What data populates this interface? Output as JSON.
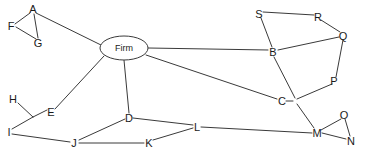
{
  "diagram": {
    "type": "node-link-graph",
    "background_color": "#ffffff",
    "line_color": "#3a3a3a",
    "label_color": "#1a1a1a",
    "width": 365,
    "height": 154,
    "hub": {
      "label": "Firm",
      "cx": 124,
      "cy": 48,
      "rx": 24,
      "ry": 12
    },
    "nodes": [
      {
        "id": "A",
        "label": "A",
        "x": 33,
        "y": 9
      },
      {
        "id": "F",
        "label": "F",
        "x": 11,
        "y": 26
      },
      {
        "id": "G",
        "label": "G",
        "x": 38,
        "y": 43
      },
      {
        "id": "H",
        "label": "H",
        "x": 13,
        "y": 99
      },
      {
        "id": "E",
        "label": "E",
        "x": 51,
        "y": 112
      },
      {
        "id": "I",
        "label": "I",
        "x": 9,
        "y": 132
      },
      {
        "id": "J",
        "label": "J",
        "x": 74,
        "y": 143
      },
      {
        "id": "D",
        "label": "D",
        "x": 129,
        "y": 118
      },
      {
        "id": "K",
        "label": "K",
        "x": 149,
        "y": 143
      },
      {
        "id": "L",
        "label": "L",
        "x": 197,
        "y": 127
      },
      {
        "id": "B",
        "label": "B",
        "x": 273,
        "y": 52
      },
      {
        "id": "S",
        "label": "S",
        "x": 259,
        "y": 14
      },
      {
        "id": "R",
        "label": "R",
        "x": 318,
        "y": 17
      },
      {
        "id": "Q",
        "label": "Q",
        "x": 343,
        "y": 36
      },
      {
        "id": "P",
        "label": "P",
        "x": 334,
        "y": 81
      },
      {
        "id": "C",
        "label": "C",
        "x": 282,
        "y": 101
      },
      {
        "id": "M",
        "label": "M",
        "x": 317,
        "y": 133
      },
      {
        "id": "O",
        "label": "O",
        "x": 344,
        "y": 115
      },
      {
        "id": "N",
        "label": "N",
        "x": 351,
        "y": 141
      }
    ],
    "junctions": [
      {
        "id": "J1",
        "x": 296,
        "y": 101
      }
    ],
    "edges": [
      {
        "from": "A",
        "to": "F",
        "points": [
          [
            30,
            13
          ],
          [
            15,
            24
          ]
        ]
      },
      {
        "from": "F",
        "to": "G",
        "points": [
          [
            16,
            27
          ],
          [
            36,
            39
          ]
        ]
      },
      {
        "from": "A",
        "to": "G",
        "points": [
          [
            34,
            14
          ],
          [
            38,
            38
          ]
        ]
      },
      {
        "from": "A",
        "to": "Firm",
        "points": [
          [
            36,
            13
          ],
          [
            101,
            45
          ]
        ]
      },
      {
        "from": "Firm",
        "to": "E",
        "points": [
          [
            104,
            56
          ],
          [
            55,
            109
          ]
        ]
      },
      {
        "from": "Firm",
        "to": "D",
        "points": [
          [
            124,
            60
          ],
          [
            129,
            113
          ]
        ]
      },
      {
        "from": "Firm",
        "to": "B",
        "points": [
          [
            148,
            48
          ],
          [
            268,
            50
          ]
        ]
      },
      {
        "from": "Firm",
        "to": "C",
        "points": [
          [
            146,
            55
          ],
          [
            277,
            99
          ]
        ]
      },
      {
        "from": "H",
        "to": "Bend1",
        "points": [
          [
            18,
            103
          ],
          [
            33,
            117
          ]
        ]
      },
      {
        "from": "Bend1",
        "to": "E",
        "points": [
          [
            33,
            117
          ],
          [
            47,
            110
          ]
        ]
      },
      {
        "from": "Bend1",
        "to": "I",
        "points": [
          [
            33,
            117
          ],
          [
            12,
            129
          ]
        ]
      },
      {
        "from": "I",
        "to": "J",
        "points": [
          [
            12,
            134
          ],
          [
            70,
            142
          ]
        ]
      },
      {
        "from": "J",
        "to": "D",
        "points": [
          [
            79,
            140
          ],
          [
            125,
            119
          ]
        ]
      },
      {
        "from": "J",
        "to": "K",
        "points": [
          [
            79,
            143
          ],
          [
            144,
            143
          ]
        ]
      },
      {
        "from": "K",
        "to": "L",
        "points": [
          [
            153,
            140
          ],
          [
            193,
            128
          ]
        ]
      },
      {
        "from": "D",
        "to": "L",
        "points": [
          [
            133,
            118
          ],
          [
            193,
            125
          ]
        ]
      },
      {
        "from": "L",
        "to": "M",
        "points": [
          [
            201,
            127
          ],
          [
            312,
            133
          ]
        ]
      },
      {
        "from": "S",
        "to": "R",
        "points": [
          [
            263,
            12
          ],
          [
            314,
            15
          ]
        ]
      },
      {
        "from": "R",
        "to": "Q",
        "points": [
          [
            321,
            20
          ],
          [
            340,
            32
          ]
        ]
      },
      {
        "from": "S",
        "to": "B",
        "points": [
          [
            261,
            18
          ],
          [
            272,
            47
          ]
        ]
      },
      {
        "from": "B",
        "to": "Q",
        "points": [
          [
            278,
            50
          ],
          [
            339,
            37
          ]
        ]
      },
      {
        "from": "Q",
        "to": "P",
        "points": [
          [
            343,
            40
          ],
          [
            336,
            77
          ]
        ]
      },
      {
        "from": "B",
        "to": "J1",
        "points": [
          [
            274,
            57
          ],
          [
            295,
            98
          ]
        ]
      },
      {
        "from": "P",
        "to": "J1",
        "points": [
          [
            332,
            84
          ],
          [
            297,
            99
          ]
        ]
      },
      {
        "from": "C",
        "to": "J1",
        "points": [
          [
            286,
            101
          ],
          [
            293,
            101
          ]
        ]
      },
      {
        "from": "J1",
        "to": "M",
        "points": [
          [
            297,
            104
          ],
          [
            314,
            128
          ]
        ]
      },
      {
        "from": "M",
        "to": "O",
        "points": [
          [
            321,
            130
          ],
          [
            341,
            119
          ]
        ]
      },
      {
        "from": "O",
        "to": "N",
        "points": [
          [
            345,
            119
          ],
          [
            350,
            136
          ]
        ]
      },
      {
        "from": "M",
        "to": "N",
        "points": [
          [
            322,
            133
          ],
          [
            346,
            139
          ]
        ]
      }
    ]
  }
}
